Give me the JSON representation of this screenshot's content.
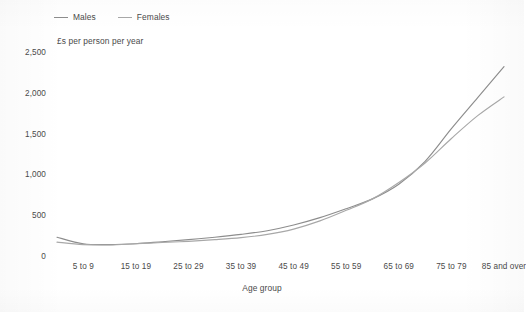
{
  "chart_data": {
    "type": "line",
    "title": "",
    "subtitle": "",
    "value_axis_title": "£s per person per year",
    "xlabel": "Age group",
    "ylabel": "",
    "ylim": [
      0,
      2500
    ],
    "yticks": [
      0,
      500,
      1000,
      1500,
      2000,
      2500
    ],
    "ytick_labels": [
      "0",
      "500",
      "1,000",
      "1,500",
      "2,000",
      "2,500"
    ],
    "grid": false,
    "legend_position": "top-left",
    "categories": [
      "0 to 4",
      "5 to 9",
      "10 to 14",
      "15 to 19",
      "20 to 24",
      "25 to 29",
      "30 to 34",
      "35 to 39",
      "40 to 44",
      "45 to 49",
      "50 to 54",
      "55 to 59",
      "60 to 64",
      "65 to 69",
      "70 to 74",
      "75 to 79",
      "80 to 84",
      "85 and over"
    ],
    "visible_tick_labels": [
      "5 to 9",
      "15 to 19",
      "25 to 29",
      "35 to 39",
      "45 to 49",
      "55 to 59",
      "65 to 69",
      "75 to 79",
      "85 and over"
    ],
    "visible_tick_indices": [
      1,
      3,
      5,
      7,
      9,
      11,
      13,
      15,
      17
    ],
    "series": [
      {
        "name": "Males",
        "color": "#8d8d8d",
        "values": [
          230,
          150,
          140,
          150,
          175,
          200,
          230,
          265,
          310,
          380,
          470,
          580,
          700,
          880,
          1160,
          1560,
          1940,
          2320
        ]
      },
      {
        "name": "Females",
        "color": "#a8a8a8",
        "values": [
          170,
          140,
          135,
          150,
          165,
          180,
          200,
          225,
          265,
          330,
          430,
          560,
          700,
          900,
          1140,
          1440,
          1720,
          1950
        ]
      }
    ]
  },
  "legend": {
    "items": [
      {
        "label": "Males",
        "swatch": "line-swatch-males"
      },
      {
        "label": "Females",
        "swatch": "line-swatch-females"
      }
    ]
  },
  "axes": {
    "value_axis_title": "£s per person per year",
    "category_axis_title": "Age group"
  }
}
